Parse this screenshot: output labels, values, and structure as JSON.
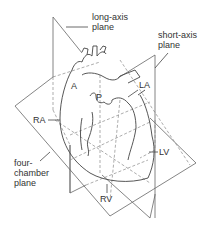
{
  "diagram": {
    "type": "anatomical-plane-diagram",
    "colors": {
      "line": "#555555",
      "dashed": "#8a8a8a",
      "text": "#333333",
      "background": "#ffffff"
    },
    "planes": [
      {
        "id": "long-axis",
        "label_line1": "long-axis",
        "label_line2": "plane"
      },
      {
        "id": "short-axis",
        "label_line1": "short-axis",
        "label_line2": "plane"
      },
      {
        "id": "four-chamber",
        "label_line1": "four-",
        "label_line2": "chamber",
        "label_line3": "plane"
      }
    ],
    "structures": {
      "A": "A",
      "P": "P",
      "LA": "LA",
      "RA": "RA",
      "LV": "LV",
      "RV": "RV"
    }
  }
}
